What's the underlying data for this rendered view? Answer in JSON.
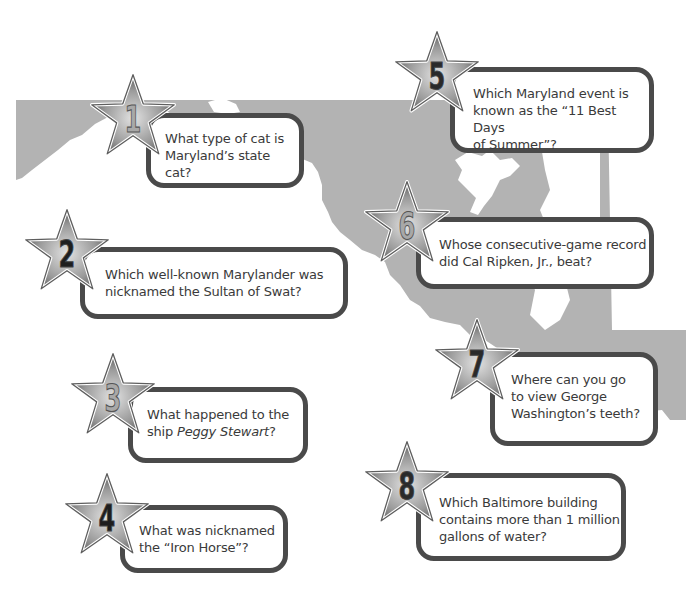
{
  "colors": {
    "map_fill": "#b3b3b3",
    "card_border": "#4a4a4a",
    "card_text": "#3a3a3a",
    "star_outer": "#6e6e6e",
    "star_inner": "#cfcfcf",
    "numeral_dark": "#2a2a2a",
    "numeral_light": "#a8a8a8"
  },
  "questions": [
    {
      "number": "1",
      "text": "What type of cat is Maryland’s state cat?",
      "line1": "What type of cat is",
      "line2": "Maryland’s state cat?",
      "numeral_style": "light"
    },
    {
      "number": "2",
      "text": "Which well-known Marylander was nicknamed the Sultan of Swat?",
      "line1": "Which well-known Marylander was",
      "line2": "nicknamed the Sultan of Swat?",
      "numeral_style": "dark"
    },
    {
      "number": "3",
      "text": "What happened to the ship Peggy Stewart?",
      "line1": "What happened to the",
      "line2_prefix": "ship ",
      "line2_italic": "Peggy Stewart",
      "line2_suffix": "?",
      "numeral_style": "light"
    },
    {
      "number": "4",
      "text": "What was nicknamed the “Iron Horse”?",
      "line1": "What was nicknamed",
      "line2": "the “Iron Horse”?",
      "numeral_style": "dark"
    },
    {
      "number": "5",
      "text": "Which Maryland event is known as the “11 Best Days of Summer”?",
      "line1": "Which Maryland event is",
      "line2": "known as the “11 Best Days",
      "line3": "of Summer”?",
      "numeral_style": "dark"
    },
    {
      "number": "6",
      "text": "Whose consecutive-game record did Cal Ripken, Jr., beat?",
      "line1": "Whose consecutive-game record",
      "line2": "did Cal Ripken, Jr., beat?",
      "numeral_style": "light"
    },
    {
      "number": "7",
      "text": "Where can you go to view George Washington’s teeth?",
      "line1": "Where can you go",
      "line2": "to view George",
      "line3": "Washington’s teeth?",
      "numeral_style": "dark"
    },
    {
      "number": "8",
      "text": "Which Baltimore building contains more than 1 million gallons of water?",
      "line1": "Which Baltimore building",
      "line2": "contains more than 1 million",
      "line3": "gallons of water?",
      "numeral_style": "dark"
    }
  ]
}
